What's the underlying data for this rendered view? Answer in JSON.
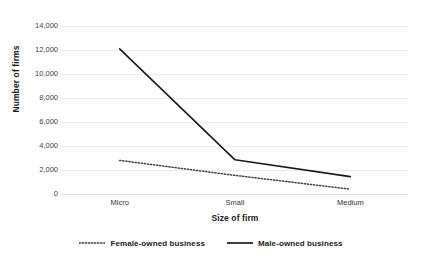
{
  "chart_data": {
    "type": "line",
    "title": "",
    "xlabel": "Size of firm",
    "ylabel": "Number of firms",
    "categories": [
      "Micro",
      "Small",
      "Medium"
    ],
    "series": [
      {
        "name": "Female-owned business",
        "style": "dotted",
        "color": "#3f3f3f",
        "values": [
          2800,
          1550,
          400
        ]
      },
      {
        "name": "Male-owned business",
        "style": "solid",
        "color": "#1a1a1a",
        "values": [
          12100,
          2850,
          1450
        ]
      }
    ],
    "ylim": [
      0,
      14000
    ],
    "ytick_values": [
      0,
      2000,
      4000,
      6000,
      8000,
      10000,
      12000,
      14000
    ],
    "ytick_labels": [
      "0",
      "2,000",
      "4,000",
      "6,000",
      "8,000",
      "10,000",
      "12,000",
      "14,000"
    ],
    "grid": true,
    "grid_color": "#ededed",
    "legend_position": "bottom",
    "background": "#ffffff"
  },
  "legend": {
    "items": [
      {
        "label": "Female-owned business",
        "marker": "dotted-line-swatch"
      },
      {
        "label": "Male-owned business",
        "marker": "solid-line-swatch"
      }
    ]
  }
}
